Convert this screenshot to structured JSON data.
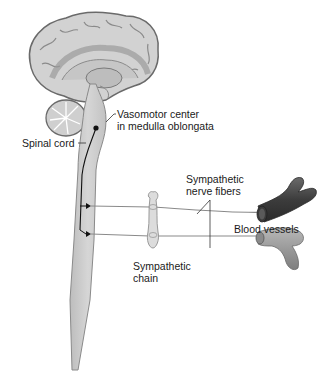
{
  "diagram": {
    "type": "anatomical-illustration",
    "labels": {
      "vasomotor": {
        "line1": "Vasomotor center",
        "line2": "in medulla oblongata"
      },
      "spinal_cord": "Spinal cord",
      "nerve_fibers": {
        "line1": "Sympathetic",
        "line2": "nerve fibers"
      },
      "blood_vessels": "Blood vessels",
      "chain": {
        "line1": "Sympathetic",
        "line2": "chain"
      }
    },
    "colors": {
      "brain_fill": "#d4d4d4",
      "brain_stroke": "#6e6e6e",
      "cord_fill": "#cfcfcf",
      "nerve_line": "#8a8a8a",
      "vessel_dark": "#4a4a4a",
      "vessel_light": "#9a9a9a",
      "pathway": "#111111"
    }
  }
}
